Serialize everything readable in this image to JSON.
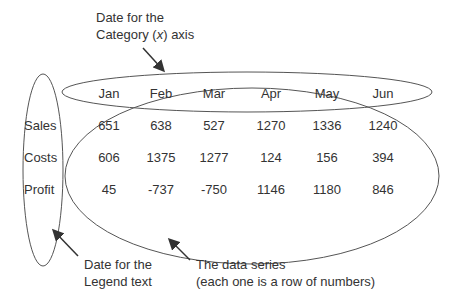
{
  "annotations": {
    "category_label_line1": "Date for the",
    "category_label_line2": "Category (x) axis",
    "legend_label_line1": "Date for the",
    "legend_label_line2": "Legend text",
    "series_label_line1": "The data series",
    "series_label_line2": "(each one is a row of numbers)"
  },
  "table": {
    "categories": [
      "Jan",
      "Feb",
      "Mar",
      "Apr",
      "May",
      "Jun"
    ],
    "rows": [
      {
        "label": "Sales",
        "values": [
          "651",
          "638",
          "527",
          "1270",
          "1336",
          "1240"
        ]
      },
      {
        "label": "Costs",
        "values": [
          "606",
          "1375",
          "1277",
          "124",
          "156",
          "394"
        ]
      },
      {
        "label": "Profit",
        "values": [
          "45",
          "-737",
          "-750",
          "1146",
          "1180",
          "846"
        ]
      }
    ]
  },
  "colors": {
    "text": "#333333",
    "lines": "#555555"
  }
}
